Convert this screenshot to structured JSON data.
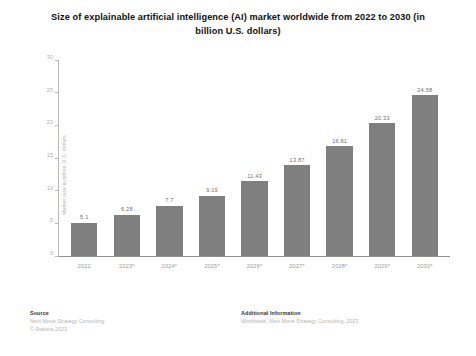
{
  "chart_data": {
    "type": "bar",
    "title": "Size of explainable artificial intelligence (AI) market worldwide from 2022 to 2030 (in billion U.S. dollars)",
    "xlabel": "",
    "ylabel": "Market size in billion U.S. dollars",
    "categories": [
      "2022",
      "2023*",
      "2024*",
      "2025*",
      "2026*",
      "2027*",
      "2028*",
      "2029*",
      "2030*"
    ],
    "values": [
      5.1,
      6.28,
      7.7,
      9.19,
      11.43,
      13.87,
      16.81,
      20.33,
      24.58
    ],
    "value_labels": [
      "5.1",
      "6.28",
      "7.7",
      "9.19",
      "11.43",
      "13.87",
      "16.81",
      "20.33",
      "24.58"
    ],
    "ylim": [
      0,
      30
    ],
    "yticks": [
      0,
      5,
      10,
      15,
      20,
      25,
      30
    ],
    "ytick_labels": [
      "0",
      "5",
      "10",
      "15",
      "20",
      "25",
      "30"
    ],
    "grid": false,
    "legend": "none",
    "bar_color": "#7f7f7f",
    "series": [
      {
        "name": "Market size",
        "values": [
          5.1,
          6.28,
          7.7,
          9.19,
          11.43,
          13.87,
          16.81,
          20.33,
          24.58
        ]
      }
    ]
  },
  "footer": {
    "source_heading": "Source",
    "source_lines": [
      "Next Move Strategy Consulting",
      "© Statista 2023"
    ],
    "additional_heading": "Additional Information",
    "additional_lines": [
      "Worldwide; Next Move Strategy Consulting; 2023"
    ]
  }
}
